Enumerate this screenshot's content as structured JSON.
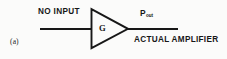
{
  "figure": {
    "part_label": "(a)",
    "background_color": "#fbfbfa",
    "ink_color": "#171717"
  },
  "diagram": {
    "type": "amplifier-block-diagram",
    "input_label": "NO INPUT",
    "triangle_label": "G",
    "output_power_label": "P",
    "output_power_subscript": "out",
    "caption_label": "ACTUAL AMPLIFIER",
    "input_line": {
      "x1": 40,
      "y1": 29,
      "x2": 92,
      "y2": 29
    },
    "output_line": {
      "x1": 128,
      "y1": 29,
      "x2": 178,
      "y2": 29
    },
    "triangle": {
      "base_x": 91,
      "top_y": 9,
      "bottom_y": 48,
      "apex_x": 128,
      "apex_y": 29
    }
  }
}
